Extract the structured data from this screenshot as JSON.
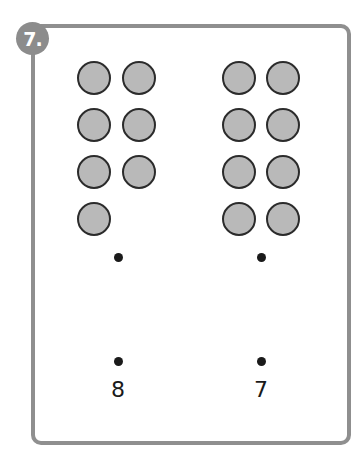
{
  "exercise": {
    "number_label": "7.",
    "left_group": {
      "counter_count": 7,
      "layout": "pairs of 2 in rows: 2,2,2,1",
      "label": "8"
    },
    "right_group": {
      "counter_count": 8,
      "layout": "pairs of 2 in rows: 2,2,2,2",
      "label": "7"
    },
    "colors": {
      "border": "#8f8f8f",
      "badge": "#8c8c8c",
      "counter_fill": "#b9b9b9",
      "counter_stroke": "#2b2b2b",
      "dot": "#1a1a1a"
    }
  }
}
